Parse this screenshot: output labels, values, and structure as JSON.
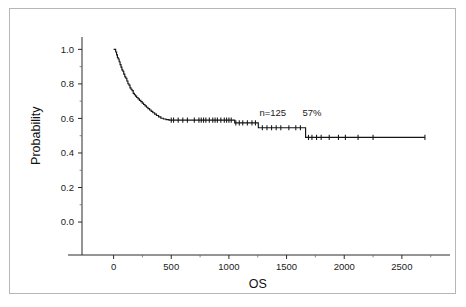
{
  "figure": {
    "background_color": "#ffffff",
    "frame_color": "#b6b6b6",
    "curve_color": "#151515",
    "axis_color": "#2a2a2a"
  },
  "chart_data": {
    "type": "line",
    "subtype": "kaplan-meier-survival-curve",
    "title": "",
    "xlabel": "OS",
    "ylabel": "Probability",
    "xlim": [
      -170,
      2900
    ],
    "ylim": [
      -0.075,
      1.06
    ],
    "grid": false,
    "legend": false,
    "xticks": [
      0,
      500,
      1000,
      1500,
      2000,
      2500
    ],
    "xtick_labels": [
      "0",
      "500",
      "1000",
      "1500",
      "2000",
      "2500"
    ],
    "x_minor_ticks": [
      250,
      750,
      1250,
      1750,
      2250,
      2750
    ],
    "yticks": [
      0.0,
      0.2,
      0.4,
      0.6,
      0.8,
      1.0
    ],
    "ytick_labels": [
      "0.0",
      "0.2",
      "0.4",
      "0.6",
      "0.8",
      "1.0"
    ],
    "y_minor_ticks": [
      0.1,
      0.3,
      0.5,
      0.7,
      0.9
    ],
    "annotations": [
      {
        "text": "n=125",
        "x": 1380,
        "y": 0.615
      },
      {
        "text": "57%",
        "x": 1720,
        "y": 0.615
      }
    ],
    "series": [
      {
        "name": "Overall survival",
        "n": 125,
        "survival_at_annotation_pct": 57,
        "step_points": [
          [
            0,
            1.0
          ],
          [
            18,
            0.985
          ],
          [
            26,
            0.968
          ],
          [
            33,
            0.952
          ],
          [
            40,
            0.944
          ],
          [
            48,
            0.928
          ],
          [
            56,
            0.912
          ],
          [
            64,
            0.897
          ],
          [
            72,
            0.881
          ],
          [
            80,
            0.873
          ],
          [
            88,
            0.857
          ],
          [
            97,
            0.841
          ],
          [
            106,
            0.833
          ],
          [
            115,
            0.817
          ],
          [
            124,
            0.801
          ],
          [
            133,
            0.793
          ],
          [
            142,
            0.777
          ],
          [
            151,
            0.769
          ],
          [
            160,
            0.761
          ],
          [
            170,
            0.745
          ],
          [
            180,
            0.737
          ],
          [
            190,
            0.729
          ],
          [
            200,
            0.721
          ],
          [
            212,
            0.713
          ],
          [
            224,
            0.705
          ],
          [
            236,
            0.697
          ],
          [
            248,
            0.689
          ],
          [
            260,
            0.681
          ],
          [
            272,
            0.673
          ],
          [
            285,
            0.665
          ],
          [
            298,
            0.657
          ],
          [
            312,
            0.649
          ],
          [
            326,
            0.641
          ],
          [
            340,
            0.633
          ],
          [
            356,
            0.625
          ],
          [
            372,
            0.617
          ],
          [
            390,
            0.609
          ],
          [
            410,
            0.601
          ],
          [
            432,
            0.597
          ],
          [
            455,
            0.593
          ],
          [
            480,
            0.59
          ],
          [
            1040,
            0.59
          ],
          [
            1050,
            0.574
          ],
          [
            1240,
            0.574
          ],
          [
            1255,
            0.546
          ],
          [
            1650,
            0.546
          ],
          [
            1665,
            0.49
          ],
          [
            2700,
            0.49
          ]
        ],
        "censor_times": [
          500,
          520,
          560,
          600,
          640,
          700,
          740,
          760,
          780,
          800,
          830,
          860,
          880,
          900,
          930,
          960,
          980,
          1000,
          1020,
          1060,
          1090,
          1120,
          1160,
          1200,
          1230,
          1290,
          1330,
          1370,
          1410,
          1450,
          1520,
          1580,
          1620,
          1690,
          1720,
          1760,
          1800,
          1870,
          1950,
          2010,
          2120,
          2250,
          2700
        ]
      }
    ]
  }
}
